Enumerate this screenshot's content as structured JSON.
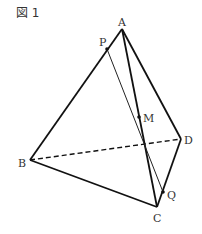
{
  "figure": {
    "title": "図 1",
    "points": {
      "A": {
        "label": "A",
        "x": 122,
        "y": 29,
        "lx": 118,
        "ly": 26
      },
      "B": {
        "label": "B",
        "x": 30,
        "y": 160,
        "lx": 18,
        "ly": 167
      },
      "C": {
        "label": "C",
        "x": 157,
        "y": 207,
        "lx": 153,
        "ly": 222
      },
      "D": {
        "label": "D",
        "x": 181,
        "y": 139,
        "lx": 184,
        "ly": 144
      },
      "M": {
        "label": "M",
        "x": 139,
        "y": 117,
        "lx": 143,
        "ly": 122
      },
      "P": {
        "label": "P",
        "x": 107,
        "y": 49,
        "lx": 99,
        "ly": 46
      },
      "Q": {
        "label": "Q",
        "x": 163,
        "y": 192,
        "lx": 167,
        "ly": 199
      }
    },
    "edges_solid": [
      "AB",
      "AC",
      "AD",
      "BC",
      "CD"
    ],
    "edges_dashed": [
      "BD"
    ],
    "thin_lines": [
      "PQ"
    ],
    "marked_points": [
      "P",
      "M",
      "Q"
    ]
  }
}
